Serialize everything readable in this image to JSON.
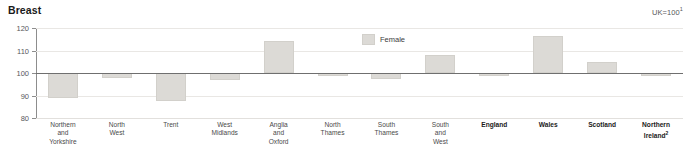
{
  "chart_data": {
    "type": "bar",
    "title": "Breast",
    "subtitle": "",
    "note": "UK=100",
    "note_superscript": "1",
    "xlabel": "",
    "ylabel": "",
    "ylim": [
      80,
      120
    ],
    "yticks": [
      80,
      90,
      100,
      110,
      120
    ],
    "grid": true,
    "reference_line": 100,
    "legend_position": "inside-top-center",
    "legend": [
      "Female"
    ],
    "categories": [
      "Northern\nand\nYorkshire",
      "North\nWest",
      "Trent",
      "West\nMidlands",
      "Anglia\nand\nOxford",
      "North\nThames",
      "South\nThames",
      "South\nand\nWest",
      "England",
      "Wales",
      "Scotland",
      "Northern\nIreland"
    ],
    "category_bold": [
      false,
      false,
      false,
      false,
      false,
      false,
      false,
      false,
      true,
      true,
      true,
      true
    ],
    "category_superscript": [
      "",
      "",
      "",
      "",
      "",
      "",
      "",
      "",
      "",
      "",
      "",
      "2"
    ],
    "series": [
      {
        "name": "Female",
        "color": "#dcdad6",
        "type": "range-box",
        "baseline": 100,
        "values": [
          89.0,
          98.0,
          87.5,
          96.8,
          114.2,
          99.2,
          97.2,
          108.2,
          99.6,
          116.5,
          104.8,
          99.5
        ],
        "box_low": [
          89.0,
          97.8,
          87.5,
          96.8,
          100.0,
          99.0,
          97.2,
          100.0,
          99.2,
          100.0,
          100.0,
          99.2
        ],
        "box_high": [
          100.0,
          100.0,
          100.0,
          100.0,
          114.2,
          100.2,
          100.0,
          108.2,
          100.2,
          116.5,
          104.8,
          100.2
        ]
      }
    ]
  },
  "legend": {
    "female_label": "Female"
  }
}
